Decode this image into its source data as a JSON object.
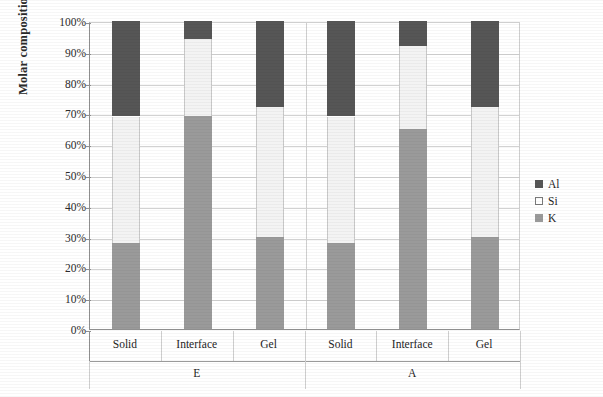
{
  "chart_data": {
    "type": "bar",
    "subtype": "stacked-column-100",
    "title": "",
    "xlabel": "",
    "ylabel": "Molar composition",
    "ylim": [
      0,
      100
    ],
    "ytick_labels": [
      "100%",
      "90%",
      "80%",
      "70%",
      "60%",
      "50%",
      "40%",
      "30%",
      "20%",
      "10%",
      "0%"
    ],
    "ytick_values": [
      100,
      90,
      80,
      70,
      60,
      50,
      40,
      30,
      20,
      10,
      0
    ],
    "grid": true,
    "legend_position": "right",
    "legend": [
      "Al",
      "Si",
      "K"
    ],
    "groups": [
      {
        "label": "E",
        "categories": [
          "Solid",
          "Interface",
          "Gel"
        ]
      },
      {
        "label": "A",
        "categories": [
          "Solid",
          "Interface",
          "Gel"
        ]
      }
    ],
    "categories": [
      "Solid",
      "Interface",
      "Gel",
      "Solid",
      "Interface",
      "Gel"
    ],
    "series": [
      {
        "name": "K",
        "color": "#9a9a9a",
        "values": [
          28,
          69,
          30,
          28,
          65,
          30
        ]
      },
      {
        "name": "Si",
        "color": "#f3f3f3",
        "values": [
          41,
          25,
          42,
          41,
          27,
          42
        ]
      },
      {
        "name": "Al",
        "color": "#565656",
        "values": [
          31,
          6,
          28,
          31,
          8,
          28
        ]
      }
    ],
    "stack_order_bottom_to_top": [
      "K",
      "Si",
      "Al"
    ],
    "bars": [
      {
        "group": "E",
        "category": "Solid",
        "K": 28,
        "Si": 41,
        "Al": 31
      },
      {
        "group": "E",
        "category": "Interface",
        "K": 69,
        "Si": 25,
        "Al": 6
      },
      {
        "group": "E",
        "category": "Gel",
        "K": 30,
        "Si": 42,
        "Al": 28
      },
      {
        "group": "A",
        "category": "Solid",
        "K": 28,
        "Si": 41,
        "Al": 31
      },
      {
        "group": "A",
        "category": "Interface",
        "K": 65,
        "Si": 27,
        "Al": 8
      },
      {
        "group": "A",
        "category": "Gel",
        "K": 30,
        "Si": 42,
        "Al": 28
      }
    ]
  },
  "axis": {
    "y_title": "Molar composition",
    "ticks": [
      "100%",
      "90%",
      "80%",
      "70%",
      "60%",
      "50%",
      "40%",
      "30%",
      "20%",
      "10%",
      "0%"
    ]
  },
  "categories_row": [
    "Solid",
    "Interface",
    "Gel",
    "Solid",
    "Interface",
    "Gel"
  ],
  "groups_row": [
    "E",
    "A"
  ],
  "legend": {
    "items": [
      {
        "label": "Al",
        "color": "#565656",
        "swatch": "filled-dark-square"
      },
      {
        "label": "Si",
        "color": "#ffffff",
        "swatch": "open-square"
      },
      {
        "label": "K",
        "color": "#9a9a9a",
        "swatch": "filled-gray-square"
      }
    ]
  },
  "colors": {
    "al": "#565656",
    "si": "#f3f3f3",
    "k": "#9a9a9a",
    "grid": "#d2d2d2",
    "axis": "#8f8f8f",
    "text": "#1f1f1f",
    "background": "#ffffff"
  }
}
